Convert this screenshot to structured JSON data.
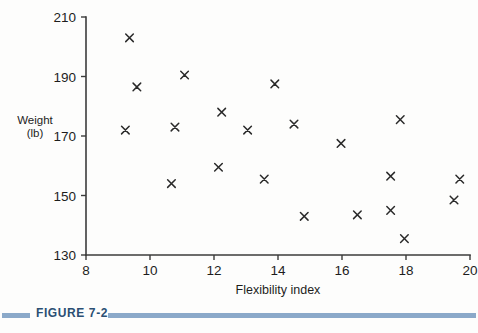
{
  "figure": {
    "label": "FIGURE 7-2",
    "accent_color": "#8ba9c9",
    "label_color": "#2b4f73"
  },
  "axis_titles": {
    "x": "Flexibility index",
    "y_line1": "Weight",
    "y_line2": "(lb)"
  },
  "chart_data": {
    "type": "scatter",
    "title": "",
    "xlabel": "Flexibility index",
    "ylabel": "Weight (lb)",
    "xlim": [
      8,
      20
    ],
    "ylim": [
      130,
      210
    ],
    "xticks": [
      8,
      10,
      12,
      14,
      16,
      18,
      20
    ],
    "yticks": [
      130,
      150,
      170,
      190,
      210
    ],
    "xtick_labels": [
      "8",
      "10",
      "12",
      "14",
      "16",
      "18",
      "20"
    ],
    "ytick_labels": [
      "130",
      "150",
      "170",
      "190",
      "210"
    ],
    "grid": false,
    "legend": false,
    "marker": "x",
    "marker_color": "#2a2a2a",
    "points": [
      {
        "x": 9.36,
        "y": 203.0
      },
      {
        "x": 9.59,
        "y": 186.5
      },
      {
        "x": 9.23,
        "y": 172.0
      },
      {
        "x": 10.67,
        "y": 154.0
      },
      {
        "x": 10.78,
        "y": 173.0
      },
      {
        "x": 11.08,
        "y": 190.5
      },
      {
        "x": 12.24,
        "y": 178.0
      },
      {
        "x": 12.14,
        "y": 159.5
      },
      {
        "x": 13.05,
        "y": 172.0
      },
      {
        "x": 13.57,
        "y": 155.5
      },
      {
        "x": 13.9,
        "y": 187.5
      },
      {
        "x": 14.5,
        "y": 174.0
      },
      {
        "x": 14.82,
        "y": 143.0
      },
      {
        "x": 15.97,
        "y": 167.5
      },
      {
        "x": 16.48,
        "y": 143.5
      },
      {
        "x": 17.52,
        "y": 156.5
      },
      {
        "x": 17.52,
        "y": 145.0
      },
      {
        "x": 17.82,
        "y": 175.5
      },
      {
        "x": 17.95,
        "y": 135.5
      },
      {
        "x": 19.5,
        "y": 148.5
      },
      {
        "x": 19.68,
        "y": 155.5
      }
    ]
  }
}
